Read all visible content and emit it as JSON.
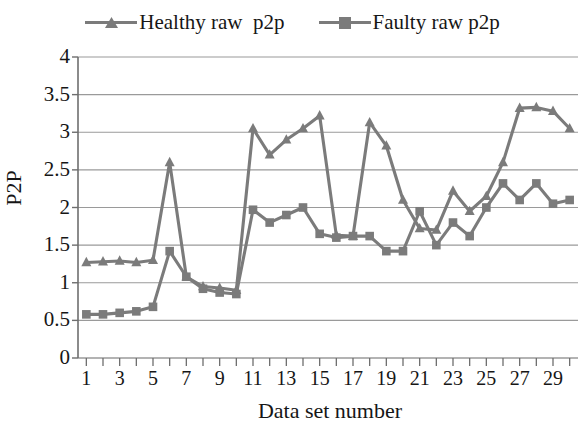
{
  "chart_data": {
    "type": "line",
    "title": "",
    "xlabel": "Data set number",
    "ylabel": "P2P",
    "xlim": [
      0.5,
      30.5
    ],
    "ylim": [
      0,
      4
    ],
    "ytick_labels": [
      "0",
      "0.5",
      "1",
      "1.5",
      "2",
      "2.5",
      "3",
      "3.5",
      "4"
    ],
    "ytick_values": [
      0,
      0.5,
      1,
      1.5,
      2,
      2.5,
      3,
      3.5,
      4
    ],
    "xtick_labels": [
      "1",
      "3",
      "5",
      "7",
      "9",
      "11",
      "13",
      "15",
      "17",
      "19",
      "21",
      "23",
      "25",
      "27",
      "29"
    ],
    "xtick_values": [
      1,
      3,
      5,
      7,
      9,
      11,
      13,
      15,
      17,
      19,
      21,
      23,
      25,
      27,
      29
    ],
    "x": [
      1,
      2,
      3,
      4,
      5,
      6,
      7,
      8,
      9,
      10,
      11,
      12,
      13,
      14,
      15,
      16,
      17,
      18,
      19,
      20,
      21,
      22,
      23,
      24,
      25,
      26,
      27,
      28,
      29,
      30
    ],
    "grid": "horizontal",
    "legend_position": "top-center",
    "series": [
      {
        "name": "Healthy raw  p2p",
        "marker": "triangle",
        "color": "#7b7b7b",
        "values": [
          1.27,
          1.28,
          1.29,
          1.27,
          1.3,
          2.6,
          1.08,
          0.95,
          0.93,
          0.9,
          3.05,
          2.7,
          2.9,
          3.05,
          3.22,
          1.63,
          1.62,
          3.13,
          2.82,
          2.1,
          1.72,
          1.7,
          2.22,
          1.95,
          2.15,
          2.6,
          3.32,
          3.33,
          3.28,
          3.05
        ]
      },
      {
        "name": "Faulty raw p2p",
        "marker": "square",
        "color": "#7b7b7b",
        "values": [
          0.58,
          0.58,
          0.6,
          0.62,
          0.68,
          1.42,
          1.08,
          0.92,
          0.87,
          0.85,
          1.97,
          1.8,
          1.9,
          2.0,
          1.65,
          1.6,
          1.62,
          1.62,
          1.42,
          1.42,
          1.95,
          1.5,
          1.8,
          1.62,
          2.0,
          2.32,
          2.1,
          2.32,
          2.05,
          2.1
        ]
      }
    ]
  },
  "legend": {
    "entries": [
      {
        "label": "Healthy raw  p2p",
        "marker": "triangle-marker-icon"
      },
      {
        "label": "Faulty raw p2p",
        "marker": "square-marker-icon"
      }
    ]
  },
  "colors": {
    "series_line": "#7b7b7b",
    "grid": "#9a9a9a",
    "axis": "#6e6e6e",
    "text": "#161616",
    "background": "#ffffff"
  }
}
